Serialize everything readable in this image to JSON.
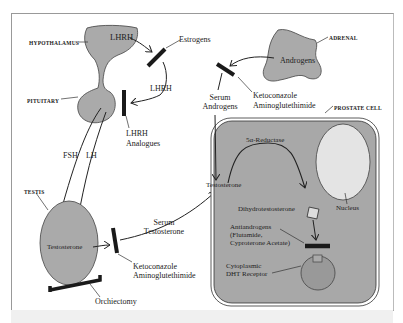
{
  "diagram": {
    "organs": {
      "hypothalamus": "HYPOTHALAMUS",
      "pituitary": "PITUITARY",
      "testis": "TESTIS",
      "adrenal": "ADRENAL",
      "prostate_cell": "PROSTATE CELL"
    },
    "hormones": {
      "lhrh_top": "LHRH",
      "lhrh_mid": "LHRH",
      "fsh": "FSH",
      "lh": "LH",
      "testosterone_testis": "Testosterone",
      "androgens": "Androgens",
      "serum_androgens_1": "Serum",
      "serum_androgens_2": "Androgens",
      "serum_testosterone_1": "Serum",
      "serum_testosterone_2": "Testosterone",
      "testosterone_cell": "Testosterone",
      "five_alpha_reductase": "5α-Reductase",
      "dht": "Dihydrotestosterone",
      "nucleus": "Nucleus"
    },
    "inhibitors": {
      "estrogens": "Estrogens",
      "lhrh_analogues_1": "LHRH",
      "lhrh_analogues_2": "Analogues",
      "keto_adrenal_1": "Ketoconazole",
      "keto_adrenal_2": "Aminoglutethimide",
      "keto_testis_1": "Ketoconazole",
      "keto_testis_2": "Aminoglutethimide",
      "orchiectomy": "Orchiectomy",
      "antiandrogens_1": "Antiandrogens",
      "antiandrogens_2": "(Flutamide,",
      "antiandrogens_3": "Cyproterone Acetate)",
      "receptor_1": "Cytoplasmic",
      "receptor_2": "DHT Receptor"
    },
    "colors": {
      "organ_fill": "#a9a9a9",
      "cell_fill": "#a4a4a4",
      "blocker": "#1a1a1a",
      "line": "#222222"
    }
  }
}
